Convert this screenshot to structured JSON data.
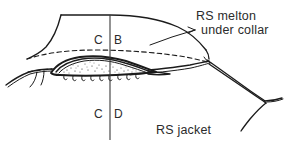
{
  "figure": {
    "background_color": "#ffffff",
    "ink_color": "#1b1b1b",
    "annotations": {
      "melton": {
        "line1": "RS melton",
        "line2": "under collar"
      },
      "jacket": "RS jacket",
      "center_back_top": {
        "left": "C",
        "right": "B"
      },
      "center_back_bottom": {
        "left": "C",
        "right": "D"
      }
    },
    "markers": {
      "centerline_name": "centre-back-line",
      "leader_name": "melton-leader-line"
    }
  }
}
